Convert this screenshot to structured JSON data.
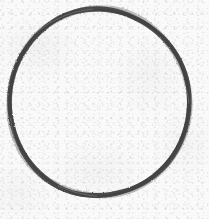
{
  "image": {
    "kind": "scanned-drawing",
    "subject": "hand-drawn circle outline",
    "width_px": 209,
    "height_px": 219,
    "background_label": "textured off-white paper",
    "background_color": "#fafafa",
    "paper_speckle_color": "#8c8c8c",
    "has_text": false,
    "has_ui_controls": false
  },
  "shape": {
    "name": "circle-outline",
    "label": "circle",
    "filled": false,
    "stroke_color": "#4a4a4a",
    "stroke_color_light": "#6e6e6e",
    "stroke_width_px": 4.6,
    "center_x_px": 99,
    "center_y_px": 102.5,
    "radius_x_px": 90.5,
    "radius_y_px": 94,
    "top_edge_y_px": 8,
    "bottom_edge_y_px": 197,
    "left_edge_x_px": 8,
    "right_edge_x_px": 190,
    "hand_drawn": true
  }
}
